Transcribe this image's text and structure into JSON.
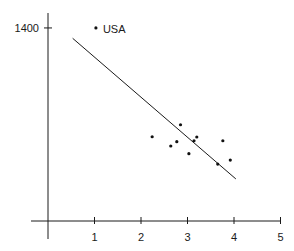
{
  "chart_data": {
    "type": "scatter",
    "title": "",
    "xlabel": "",
    "ylabel": "",
    "xlim": [
      0,
      5
    ],
    "ylim": [
      0,
      1400
    ],
    "grid": false,
    "x_ticks": [
      "1",
      "2",
      "3",
      "4",
      "5"
    ],
    "y_ticks": [
      "1400"
    ],
    "series": [
      {
        "name": "points",
        "points": [
          {
            "x": 1.03,
            "y": 1400,
            "label": "USA"
          },
          {
            "x": 2.24,
            "y": 611
          },
          {
            "x": 2.64,
            "y": 544
          },
          {
            "x": 2.77,
            "y": 575
          },
          {
            "x": 2.85,
            "y": 698
          },
          {
            "x": 3.03,
            "y": 488
          },
          {
            "x": 3.14,
            "y": 582
          },
          {
            "x": 3.2,
            "y": 609
          },
          {
            "x": 3.65,
            "y": 413
          },
          {
            "x": 3.76,
            "y": 582
          },
          {
            "x": 3.92,
            "y": 442
          }
        ]
      }
    ],
    "trendline": {
      "x1": 0.53,
      "y1": 1325,
      "x2": 4.04,
      "y2": 305
    },
    "annotations": [
      {
        "text": "USA",
        "x": 1.03,
        "y": 1400
      }
    ]
  },
  "layout": {
    "origin_px": [
      48,
      221
    ],
    "x_px_per_unit": 46.5,
    "y_px_per_unit": 0.1379,
    "axis_color": "#1a1a1a",
    "point_color": "#111111"
  }
}
